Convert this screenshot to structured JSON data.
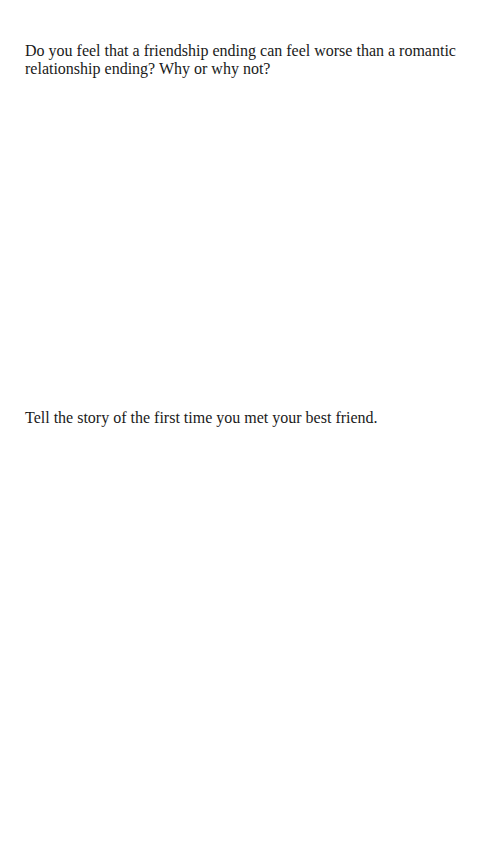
{
  "document": {
    "prompts": [
      {
        "text": "Do you feel that a friendship ending can feel worse than a romantic relationship ending? Why or why not?"
      },
      {
        "text": "Tell the story of the first time you met your best friend."
      }
    ]
  }
}
